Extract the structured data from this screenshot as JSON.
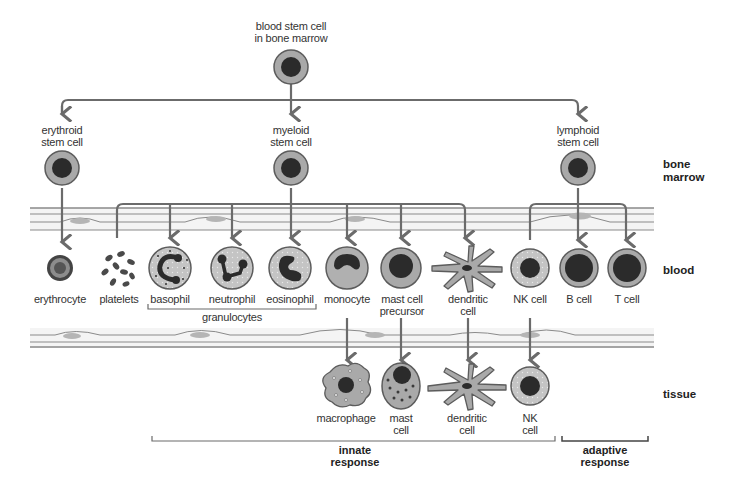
{
  "colors": {
    "line": "#6b6b6b",
    "cell_outer": "#a9a9a9",
    "cell_ring": "#5c5c5c",
    "nucleus": "#2b2b2b",
    "cytoplasm_light": "#c8c8c8",
    "vessel_fill": "#f4f4f4",
    "vessel_nucleus": "#b5b5b5",
    "text": "#333333"
  },
  "root": {
    "label": "blood stem cell\nin bone marrow"
  },
  "progenitors": [
    {
      "id": "erythroid",
      "label": "erythroid\nstem cell"
    },
    {
      "id": "myeloid",
      "label": "myeloid\nstem cell"
    },
    {
      "id": "lymphoid",
      "label": "lymphoid\nstem cell"
    }
  ],
  "blood_cells": [
    {
      "id": "erythrocyte",
      "label": "erythrocyte"
    },
    {
      "id": "platelets",
      "label": "platelets"
    },
    {
      "id": "basophil",
      "label": "basophil"
    },
    {
      "id": "neutrophil",
      "label": "neutrophil"
    },
    {
      "id": "eosinophil",
      "label": "eosinophil"
    },
    {
      "id": "monocyte",
      "label": "monocyte"
    },
    {
      "id": "mast-cell-precursor",
      "label": "mast cell\nprecursor"
    },
    {
      "id": "dendritic-cell",
      "label": "dendritic\ncell"
    },
    {
      "id": "nk-cell",
      "label": "NK cell"
    },
    {
      "id": "b-cell",
      "label": "B cell"
    },
    {
      "id": "t-cell",
      "label": "T cell"
    }
  ],
  "granulocytes_label": "granulocytes",
  "tissue_cells": [
    {
      "id": "macrophage",
      "label": "macrophage"
    },
    {
      "id": "mast-cell",
      "label": "mast\ncell"
    },
    {
      "id": "dendritic-cell-tissue",
      "label": "dendritic\ncell"
    },
    {
      "id": "nk-cell-tissue",
      "label": "NK\ncell"
    }
  ],
  "zones": {
    "bone_marrow": "bone\nmarrow",
    "blood": "blood",
    "tissue": "tissue"
  },
  "responses": {
    "innate": "innate\nresponse",
    "adaptive": "adaptive\nresponse"
  }
}
